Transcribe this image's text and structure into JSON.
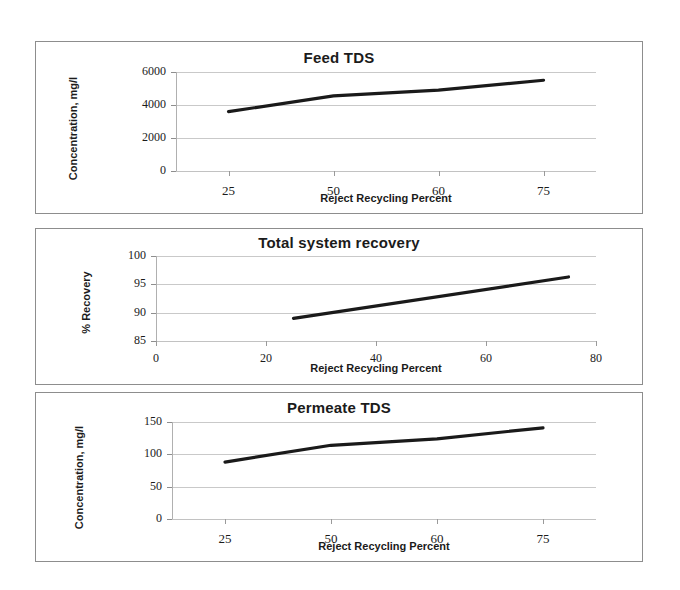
{
  "figure": {
    "panel_count": 3,
    "background_color": "#ffffff",
    "frame_color": "#8d8d8d",
    "series_color": "#1a1a1a",
    "gridline_color": "#c9c9c9"
  },
  "chart_data": [
    {
      "id": "feed-tds",
      "type": "line",
      "title": "Feed TDS",
      "xlabel": "Reject Recycling Percent",
      "ylabel": "Concentration, mg/l",
      "axis_kind": "categorical",
      "categories": [
        "25",
        "50",
        "60",
        "75"
      ],
      "x": [
        25,
        50,
        60,
        75
      ],
      "values": [
        3600,
        4550,
        4900,
        5500
      ],
      "series": [
        {
          "name": "Feed TDS",
          "values": [
            3600,
            4550,
            4900,
            5500
          ]
        }
      ],
      "ylim": [
        0,
        6000
      ],
      "yticks": [
        "0",
        "2000",
        "4000",
        "6000"
      ],
      "ytick_values": [
        0,
        2000,
        4000,
        6000
      ],
      "xticks": [
        "25",
        "50",
        "60",
        "75"
      ],
      "grid": true,
      "legend": false
    },
    {
      "id": "total-system-recovery",
      "type": "line",
      "title": "Total system recovery",
      "xlabel": "Reject Recycling Percent",
      "ylabel": "% Recovery",
      "axis_kind": "numeric",
      "x": [
        25,
        75
      ],
      "values": [
        89.0,
        96.3
      ],
      "series": [
        {
          "name": "Total system recovery",
          "values": [
            89.0,
            96.3
          ]
        }
      ],
      "ylim": [
        85,
        100
      ],
      "yticks": [
        "85",
        "90",
        "95",
        "100"
      ],
      "ytick_values": [
        85,
        90,
        95,
        100
      ],
      "xlim": [
        0,
        80
      ],
      "xticks": [
        "0",
        "20",
        "40",
        "60",
        "80"
      ],
      "xtick_values": [
        0,
        20,
        40,
        60,
        80
      ],
      "grid": true,
      "legend": false
    },
    {
      "id": "permeate-tds",
      "type": "line",
      "title": "Permeate TDS",
      "xlabel": "Reject Recycling Percent",
      "ylabel": "Concentration, mg/l",
      "axis_kind": "categorical",
      "categories": [
        "25",
        "50",
        "60",
        "75"
      ],
      "x": [
        25,
        50,
        60,
        75
      ],
      "values": [
        88,
        114,
        124,
        141
      ],
      "series": [
        {
          "name": "Permeate TDS",
          "values": [
            88,
            114,
            124,
            141
          ]
        }
      ],
      "ylim": [
        0,
        150
      ],
      "yticks": [
        "0",
        "50",
        "100",
        "150"
      ],
      "ytick_values": [
        0,
        50,
        100,
        150
      ],
      "xticks": [
        "25",
        "50",
        "60",
        "75"
      ],
      "grid": true,
      "legend": false
    }
  ]
}
